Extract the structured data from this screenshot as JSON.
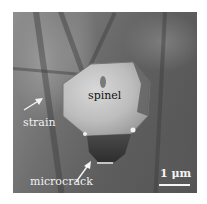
{
  "figure": {
    "type": "TEM micrograph",
    "labels": {
      "particle": "spinel",
      "strain": "strain",
      "microcrack": "microcrack"
    },
    "scale_bar": {
      "label": "1 μm",
      "color": "#f5f5f5"
    },
    "colors": {
      "background": "#ffffff",
      "particle_light": "#c9c9c9",
      "particle_dark": "#3a3a3a",
      "matrix": "#666666",
      "annotation": "#f2f2f2"
    }
  }
}
